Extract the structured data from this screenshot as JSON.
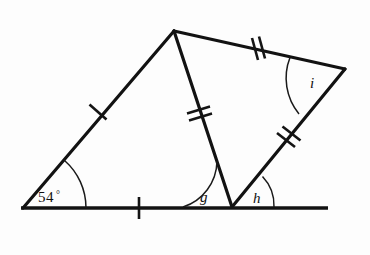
{
  "figure": {
    "stroke_color": "#121212",
    "background_color": "#fdfdfd"
  },
  "angles": [
    {
      "id": "angle-54",
      "label": "54",
      "degree_symbol": "°",
      "full_label": "54°",
      "vertex": "left-vertex",
      "x": 38,
      "y": 202
    },
    {
      "id": "angle-g",
      "label": "g",
      "vertex": "bottom-middle-vertex",
      "x": 200,
      "y": 202
    },
    {
      "id": "angle-h",
      "label": "h",
      "vertex": "bottom-middle-vertex",
      "x": 253,
      "y": 203
    },
    {
      "id": "angle-i",
      "label": "i",
      "vertex": "right-vertex",
      "x": 310,
      "y": 88
    }
  ],
  "vertices": [
    {
      "name": "left-vertex",
      "x": 23,
      "y": 208
    },
    {
      "name": "apex-vertex",
      "x": 174,
      "y": 31
    },
    {
      "name": "bottom-middle-vertex",
      "x": 232,
      "y": 207
    },
    {
      "name": "right-vertex",
      "x": 345,
      "y": 69
    },
    {
      "name": "baseline-right-end",
      "x": 328,
      "y": 208
    }
  ],
  "segments": [
    {
      "name": "segment-left-slant",
      "from": "left-vertex",
      "to": "apex-vertex",
      "ticks": 1
    },
    {
      "name": "segment-middle",
      "from": "apex-vertex",
      "to": "bottom-middle-vertex",
      "ticks": 2
    },
    {
      "name": "segment-top-right",
      "from": "apex-vertex",
      "to": "right-vertex",
      "ticks": 2
    },
    {
      "name": "segment-lower-right",
      "from": "right-vertex",
      "to": "bottom-middle-vertex",
      "ticks": 2
    },
    {
      "name": "segment-baseline",
      "from": "left-vertex",
      "to": "baseline-right-end",
      "ticks": 1
    }
  ],
  "tick_marks": [
    {
      "name": "tick-left-slant",
      "x": 98,
      "y": 112,
      "count": 1,
      "angle_deg": 130
    },
    {
      "name": "tick-baseline",
      "x": 139,
      "y": 208,
      "count": 1,
      "angle_deg": 90
    },
    {
      "name": "tick-middle",
      "x": 199,
      "y": 113,
      "count": 2,
      "angle_deg": 106
    },
    {
      "name": "tick-top-right",
      "x": 258,
      "y": 49,
      "count": 2,
      "angle_deg": 105
    },
    {
      "name": "tick-lower-right",
      "x": 288,
      "y": 138,
      "count": 2,
      "angle_deg": 140
    }
  ]
}
